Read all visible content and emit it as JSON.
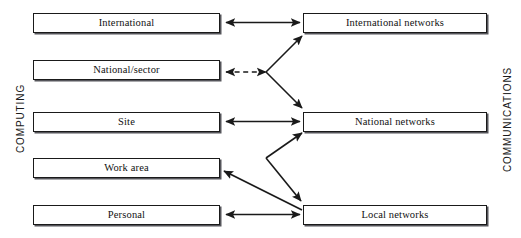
{
  "diagram": {
    "axis_labels": {
      "left": "COMPUTING",
      "right": "COMMUNICATIONS"
    },
    "computing_nodes": [
      {
        "id": "international",
        "label": "International"
      },
      {
        "id": "national-sector",
        "label": "National/sector"
      },
      {
        "id": "site",
        "label": "Site"
      },
      {
        "id": "work-area",
        "label": "Work area"
      },
      {
        "id": "personal",
        "label": "Personal"
      }
    ],
    "communications_nodes": [
      {
        "id": "international-networks",
        "label": "International networks"
      },
      {
        "id": "national-networks",
        "label": "National networks"
      },
      {
        "id": "local-networks",
        "label": "Local networks"
      }
    ],
    "connections": [
      {
        "from": "international",
        "to": "international-networks",
        "style": "solid",
        "heads": "both"
      },
      {
        "from": "national-sector",
        "to": "junction-upper",
        "style": "dashed",
        "heads": "both"
      },
      {
        "from": "junction-upper",
        "to": "international-networks",
        "style": "solid",
        "heads": "end"
      },
      {
        "from": "junction-upper",
        "to": "national-networks",
        "style": "solid",
        "heads": "end"
      },
      {
        "from": "site",
        "to": "national-networks",
        "style": "solid",
        "heads": "both"
      },
      {
        "from": "junction-lower",
        "to": "national-networks",
        "style": "solid",
        "heads": "end"
      },
      {
        "from": "junction-lower",
        "to": "local-networks",
        "style": "solid",
        "heads": "end"
      },
      {
        "from": "local-networks",
        "to": "work-area",
        "style": "solid",
        "heads": "end"
      },
      {
        "from": "personal",
        "to": "local-networks",
        "style": "solid",
        "heads": "both"
      }
    ],
    "colors": {
      "stroke": "#1a1a1a",
      "box_fill": "#ffffff",
      "shadow": "#55555a",
      "background": "#ffffff"
    }
  }
}
